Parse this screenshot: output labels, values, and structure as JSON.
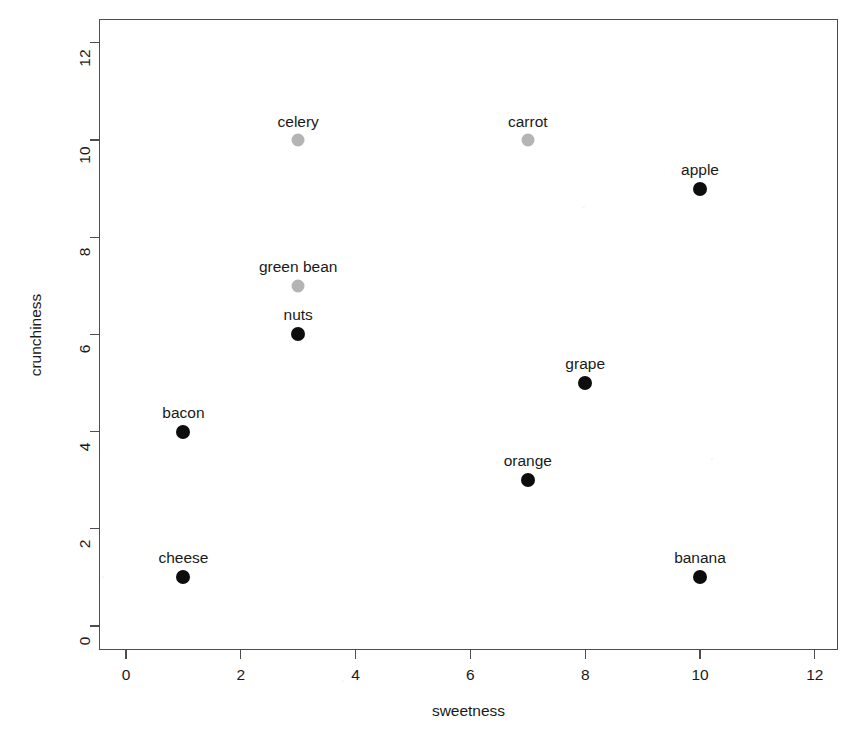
{
  "chart_data": {
    "type": "scatter",
    "title": "",
    "xlabel": "sweetness",
    "ylabel": "crunchiness",
    "xlim": [
      -0.45,
      12.75
    ],
    "ylim": [
      -0.45,
      12.95
    ],
    "xticks": [
      0,
      2,
      4,
      6,
      8,
      10,
      12
    ],
    "yticks": [
      0,
      2,
      4,
      6,
      8,
      10,
      12
    ],
    "xticklabels": [
      "0",
      "2",
      "4",
      "6",
      "8",
      "10",
      "12"
    ],
    "yticklabels": [
      "0",
      "2",
      "4",
      "6",
      "8",
      "10",
      "12"
    ],
    "grid": false,
    "legend": null,
    "colors": {
      "vegetable": "#b4b4b4",
      "other": "#0d0d0d",
      "axis": "#4d4d4d",
      "text": "#1a1a1a",
      "background": "#ffffff"
    },
    "points": [
      {
        "label": "celery",
        "x": 3,
        "y": 10,
        "color": "#b4b4b4",
        "radius": 6.5
      },
      {
        "label": "carrot",
        "x": 7,
        "y": 10,
        "color": "#b4b4b4",
        "radius": 6.5
      },
      {
        "label": "apple",
        "x": 10,
        "y": 9,
        "color": "#0d0d0d",
        "radius": 7.0
      },
      {
        "label": "green bean",
        "x": 3,
        "y": 7,
        "color": "#b4b4b4",
        "radius": 6.5
      },
      {
        "label": "nuts",
        "x": 3,
        "y": 6,
        "color": "#0d0d0d",
        "radius": 7.0
      },
      {
        "label": "grape",
        "x": 8,
        "y": 5,
        "color": "#0d0d0d",
        "radius": 7.0
      },
      {
        "label": "bacon",
        "x": 1,
        "y": 4,
        "color": "#0d0d0d",
        "radius": 7.0
      },
      {
        "label": "orange",
        "x": 7,
        "y": 3,
        "color": "#0d0d0d",
        "radius": 7.0
      },
      {
        "label": "cheese",
        "x": 1,
        "y": 1,
        "color": "#0d0d0d",
        "radius": 7.0
      },
      {
        "label": "banana",
        "x": 10,
        "y": 1,
        "color": "#0d0d0d",
        "radius": 7.0
      }
    ]
  },
  "plot": {
    "box": {
      "left": 99,
      "top": 19,
      "width": 739,
      "height": 631
    },
    "origin_px": {
      "x": 126,
      "y": 626
    },
    "scale_px_per_unit": {
      "x": 57.4,
      "y": 48.6
    }
  }
}
